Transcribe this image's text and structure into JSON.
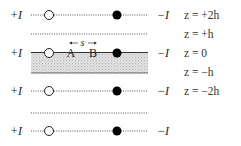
{
  "diagram": {
    "type": "image-current-method",
    "rows": [
      {
        "left_label": "+I",
        "right_label": "−I",
        "z_label": "z = +2h",
        "style": "dotted",
        "has_charges": true
      },
      {
        "left_label": "",
        "right_label": "",
        "z_label": "z = +h",
        "style": "dotted",
        "has_charges": false
      },
      {
        "left_label": "+I",
        "right_label": "−I",
        "z_label": "z = 0",
        "style": "solid",
        "has_charges": true,
        "points": [
          "A",
          "B"
        ],
        "spacing_label": "s"
      },
      {
        "left_label": "",
        "right_label": "",
        "z_label": "z = −h",
        "style": "slab-bottom",
        "has_charges": false
      },
      {
        "left_label": "+I",
        "right_label": "−I",
        "z_label": "z = −2h",
        "style": "dotted",
        "has_charges": true
      },
      {
        "left_label": "",
        "right_label": "",
        "z_label": "",
        "style": "dotted",
        "has_charges": false
      },
      {
        "left_label": "+I",
        "right_label": "−I",
        "z_label": "",
        "style": "dotted",
        "has_charges": true
      }
    ],
    "labels": {
      "plus_current": "+I",
      "minus_current": "−I",
      "point_a": "A",
      "point_b": "B",
      "spacing": "s",
      "z_plus_2h": "z = +2h",
      "z_plus_h": "z = +h",
      "z_zero": "z = 0",
      "z_minus_h": "z = −h",
      "z_minus_2h": "z = −2h"
    },
    "colors": {
      "slab_fill": "#d9d9d9",
      "line": "#444444",
      "source_fill": "#ffffff",
      "sink_fill": "#000000"
    }
  }
}
